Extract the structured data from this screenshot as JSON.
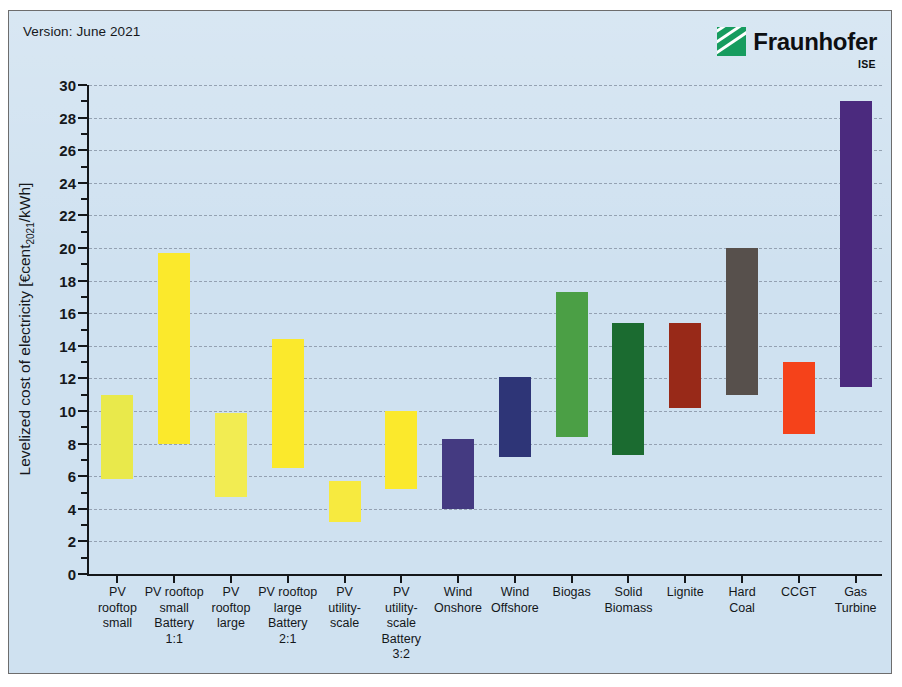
{
  "figure": {
    "version_note": "Version: June 2021",
    "logo": {
      "name": "Fraunhofer",
      "sub": "ISE",
      "mark_color": "#179c5f"
    },
    "background_color": "#cfe1f0"
  },
  "chart_data": {
    "type": "bar",
    "subtype": "floating-range-bar",
    "title": "",
    "xlabel": "",
    "ylabel": "Levelized cost of electricity [€cent2021/kWh]",
    "ylabel_prefix": "Levelized cost of electricity [€cent",
    "ylabel_sub": "2021",
    "ylabel_suffix": "/kWh]",
    "ylim": [
      0,
      30
    ],
    "ytick_step": 2,
    "yticks": [
      0,
      2,
      4,
      6,
      8,
      10,
      12,
      14,
      16,
      18,
      20,
      22,
      24,
      26,
      28,
      30
    ],
    "ytick_labels": [
      "0",
      "2",
      "4",
      "6",
      "8",
      "10",
      "12",
      "14",
      "16",
      "18",
      "20",
      "22",
      "24",
      "26",
      "28",
      "30"
    ],
    "grid": true,
    "grid_style": "dashed",
    "legend": "none",
    "categories": [
      "PV\nrooftop\nsmall",
      "PV rooftop\nsmall\nBattery\n1:1",
      "PV\nrooftop\nlarge",
      "PV rooftop\nlarge\nBattery\n2:1",
      "PV\nutility-\nscale",
      "PV\nutility-\nscale\nBattery\n3:2",
      "Wind\nOnshore",
      "Wind\nOffshore",
      "Biogas",
      "Solid\nBiomass",
      "Lignite",
      "Hard\nCoal",
      "CCGT",
      "Gas\nTurbine"
    ],
    "series": [
      {
        "name": "LCOE range",
        "points": [
          {
            "category": "PV rooftop small",
            "low": 5.8,
            "high": 11.0,
            "color": "#e9e94b"
          },
          {
            "category": "PV rooftop small Battery 1:1",
            "low": 8.0,
            "high": 19.7,
            "color": "#fbe92c"
          },
          {
            "category": "PV rooftop large",
            "low": 4.7,
            "high": 9.9,
            "color": "#f2ec52"
          },
          {
            "category": "PV rooftop large Battery 2:1",
            "low": 6.5,
            "high": 14.4,
            "color": "#fbe92c"
          },
          {
            "category": "PV utility-scale",
            "low": 3.2,
            "high": 5.7,
            "color": "#f7ea3f"
          },
          {
            "category": "PV utility-scale Battery 3:2",
            "low": 5.2,
            "high": 10.0,
            "color": "#fbe92c"
          },
          {
            "category": "Wind Onshore",
            "low": 4.0,
            "high": 8.3,
            "color": "#443a81"
          },
          {
            "category": "Wind Offshore",
            "low": 7.2,
            "high": 12.1,
            "color": "#2e3577"
          },
          {
            "category": "Biogas",
            "low": 8.4,
            "high": 17.3,
            "color": "#4b9f45"
          },
          {
            "category": "Solid Biomass",
            "low": 7.3,
            "high": 15.4,
            "color": "#1b6b30"
          },
          {
            "category": "Lignite",
            "low": 10.2,
            "high": 15.4,
            "color": "#982918"
          },
          {
            "category": "Hard Coal",
            "low": 11.0,
            "high": 20.0,
            "color": "#57504c"
          },
          {
            "category": "CCGT",
            "low": 8.6,
            "high": 13.0,
            "color": "#f5421a"
          },
          {
            "category": "Gas Turbine",
            "low": 11.5,
            "high": 29.0,
            "color": "#4b2a7e"
          }
        ]
      }
    ]
  }
}
